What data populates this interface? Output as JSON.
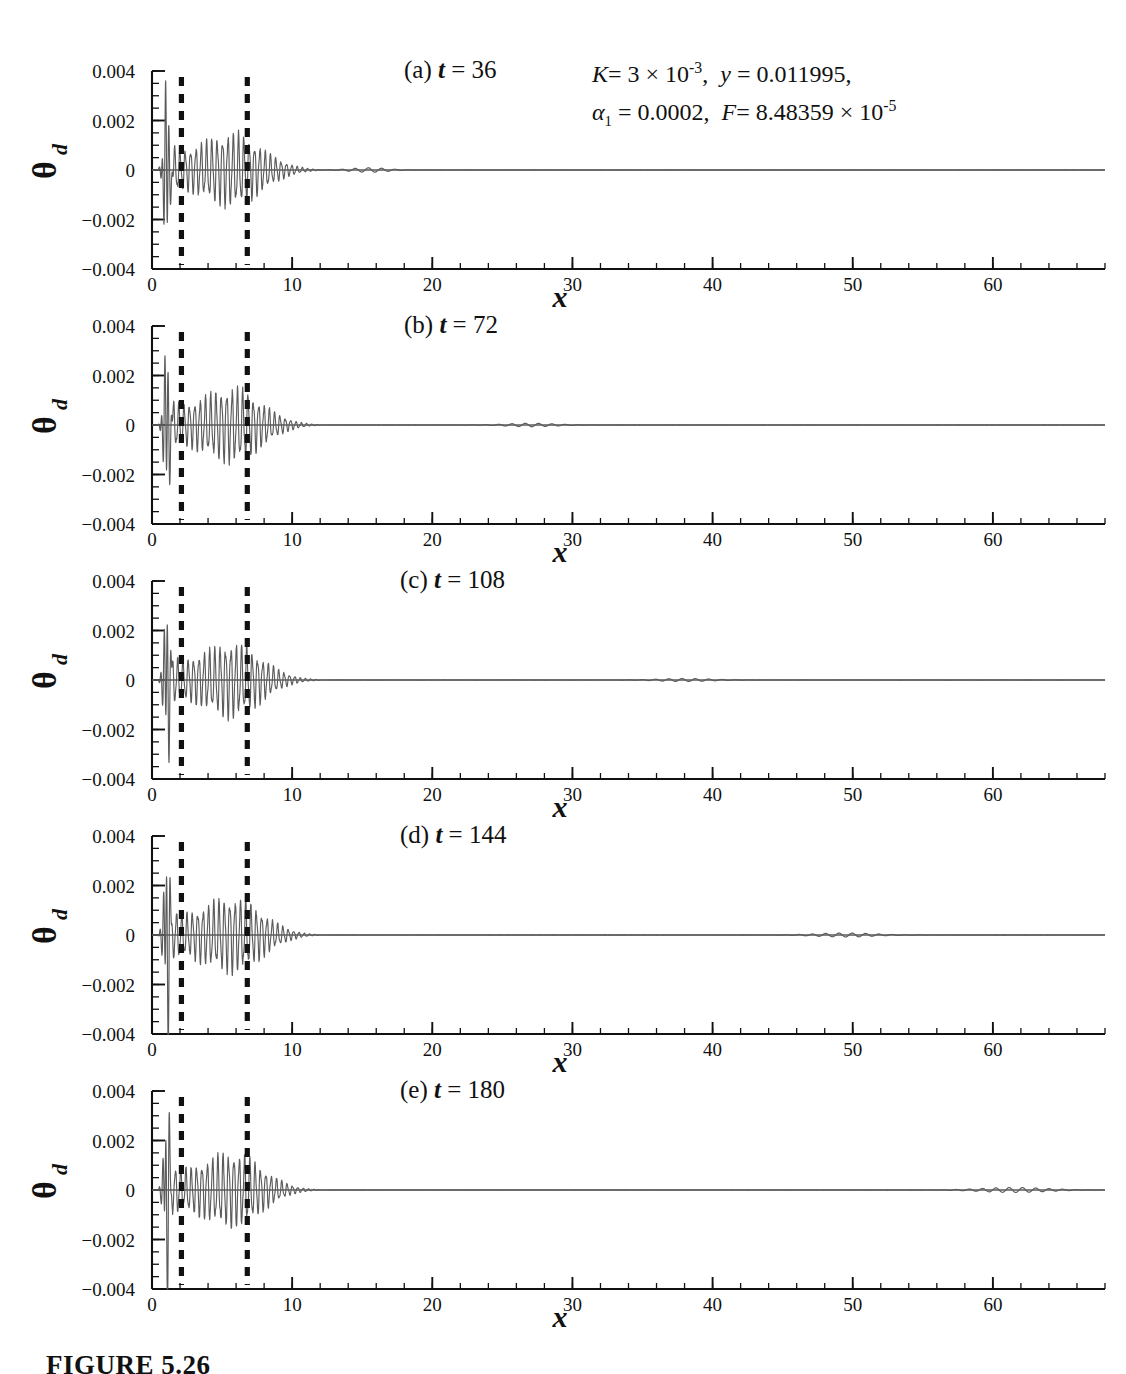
{
  "figure": {
    "caption": "FIGURE 5.26",
    "xlabel": "x",
    "ylabel_symbol": "θ",
    "ylabel_subscript": "d"
  },
  "parameters": {
    "line1_k_symbol": "K",
    "line1_k_value": "= 3 × 10",
    "line1_k_exp": "-3",
    "line1_y_symbol": "y",
    "line1_y_value": "= 0.011995,",
    "line2_alpha_symbol": "α",
    "line2_alpha_sub": "1",
    "line2_alpha_value": "= 0.0002,",
    "line2_f_symbol": "F",
    "line2_f_value": "= 8.48359 × 10",
    "line2_f_exp": "-5",
    "full_text": "K = 3 × 10^-3, y = 0.011995, α₁ = 0.0002, F = 8.48359 × 10^-5"
  },
  "axes": {
    "y_ticks": [
      "0.004",
      "0.002",
      "0",
      "−0.002",
      "−0.004"
    ],
    "y_tick_values": [
      0.004,
      0.002,
      0,
      -0.002,
      -0.004
    ],
    "y_range": [
      -0.004,
      0.004
    ],
    "x_ticks": [
      "0",
      "10",
      "20",
      "30",
      "40",
      "50",
      "60"
    ],
    "x_tick_values": [
      0,
      10,
      20,
      30,
      40,
      50,
      60
    ],
    "x_range": [
      0,
      68
    ],
    "x_minor_step": 2,
    "y_minor_step": 0.0005
  },
  "markers": {
    "label": "dashed vertical reference lines",
    "x_positions": [
      2.1,
      6.8
    ]
  },
  "panels": [
    {
      "id": "a",
      "tag": "(a)",
      "t_symbol": "t",
      "t_value": "= 36",
      "time": 36,
      "title_left": 404
    },
    {
      "id": "b",
      "tag": "(b)",
      "t_symbol": "t",
      "t_value": "= 72",
      "time": 72,
      "title_left": 404
    },
    {
      "id": "c",
      "tag": "(c)",
      "t_symbol": "t",
      "t_value": "= 108",
      "time": 108,
      "title_left": 400
    },
    {
      "id": "d",
      "tag": "(d)",
      "t_symbol": "t",
      "t_value": "= 144",
      "time": 144,
      "title_left": 400
    },
    {
      "id": "e",
      "tag": "(e)",
      "t_symbol": "t",
      "t_value": "= 180",
      "time": 180,
      "title_left": 400
    }
  ],
  "chart_data": {
    "type": "line",
    "xlabel": "x",
    "ylabel": "θ_d",
    "xlim": [
      0,
      68
    ],
    "ylim": [
      -0.004,
      0.004
    ],
    "grid": false,
    "legend": "none",
    "n_panels": 5,
    "annotations": [
      "K = 3 × 10^-3",
      "y = 0.011995",
      "α_1 = 0.0002",
      "F = 8.48359 × 10^-5"
    ],
    "vertical_markers_x": [
      2.1,
      6.8
    ],
    "series": [
      {
        "name": "(a) t = 36",
        "panel": "a",
        "carrier_wavelength": 0.38,
        "spike": {
          "x": 1.05,
          "half_width": 0.55,
          "amplitude": 0.003
        },
        "envelope_x": [
          1.3,
          1.8,
          2.1,
          2.6,
          3.2,
          3.8,
          4.4,
          5.0,
          5.6,
          6.2,
          6.8,
          7.4,
          8.0,
          8.6,
          9.2,
          9.8,
          10.5,
          11.2,
          12.0
        ],
        "envelope_y": [
          0.0009,
          0.00075,
          0.0007,
          0.00074,
          0.00085,
          0.00098,
          0.0011,
          0.00122,
          0.00128,
          0.00125,
          0.00112,
          0.00092,
          0.0007,
          0.0005,
          0.00034,
          0.00021,
          0.00011,
          5e-05,
          1e-05
        ],
        "downstream_packet": {
          "center": 15.5,
          "width": 2.2,
          "amplitude": 9e-05
        }
      },
      {
        "name": "(b) t = 72",
        "panel": "b",
        "carrier_wavelength": 0.38,
        "spike": {
          "x": 1.05,
          "half_width": 0.55,
          "amplitude": 0.0029
        },
        "envelope_x": [
          1.3,
          1.8,
          2.1,
          2.6,
          3.2,
          3.8,
          4.4,
          5.0,
          5.6,
          6.2,
          6.8,
          7.4,
          8.0,
          8.6,
          9.2,
          9.8,
          10.5,
          11.2,
          12.0
        ],
        "envelope_y": [
          0.00092,
          0.00078,
          0.00072,
          0.00076,
          0.00088,
          0.001,
          0.00112,
          0.00124,
          0.0013,
          0.00126,
          0.00114,
          0.00093,
          0.00071,
          0.0005,
          0.00033,
          0.0002,
          0.0001,
          4e-05,
          1e-05
        ],
        "downstream_packet": {
          "center": 27.0,
          "width": 3.0,
          "amplitude": 7e-05
        }
      },
      {
        "name": "(c) t = 108",
        "panel": "c",
        "carrier_wavelength": 0.38,
        "spike": {
          "x": 1.05,
          "half_width": 0.55,
          "amplitude": 0.0028
        },
        "envelope_x": [
          1.3,
          1.8,
          2.1,
          2.6,
          3.2,
          3.8,
          4.4,
          5.0,
          5.6,
          6.2,
          6.8,
          7.4,
          8.0,
          8.6,
          9.2,
          9.8,
          10.5,
          11.2,
          12.0
        ],
        "envelope_y": [
          0.0009,
          0.00076,
          0.00071,
          0.00075,
          0.00087,
          0.00099,
          0.00111,
          0.00123,
          0.00129,
          0.00125,
          0.00113,
          0.00092,
          0.0007,
          0.00049,
          0.00032,
          0.00019,
          9e-05,
          4e-05,
          1e-05
        ],
        "downstream_packet": {
          "center": 38.0,
          "width": 3.2,
          "amplitude": 6e-05
        }
      },
      {
        "name": "(d) t = 144",
        "panel": "d",
        "carrier_wavelength": 0.38,
        "spike": {
          "x": 1.05,
          "half_width": 0.55,
          "amplitude": 0.0031
        },
        "envelope_x": [
          1.3,
          1.8,
          2.1,
          2.6,
          3.2,
          3.8,
          4.4,
          5.0,
          5.6,
          6.2,
          6.8,
          7.4,
          8.0,
          8.6,
          9.2,
          9.8,
          10.5,
          11.2,
          12.0
        ],
        "envelope_y": [
          0.00094,
          0.00079,
          0.00073,
          0.00077,
          0.00089,
          0.00101,
          0.00113,
          0.00125,
          0.00131,
          0.00127,
          0.00115,
          0.00094,
          0.00072,
          0.00051,
          0.00034,
          0.0002,
          0.0001,
          4e-05,
          1e-05
        ],
        "downstream_packet": {
          "center": 49.5,
          "width": 3.6,
          "amplitude": 8e-05
        }
      },
      {
        "name": "(e) t = 180",
        "panel": "e",
        "carrier_wavelength": 0.38,
        "spike": {
          "x": 1.05,
          "half_width": 0.55,
          "amplitude": 0.003
        },
        "envelope_x": [
          1.3,
          1.8,
          2.1,
          2.6,
          3.2,
          3.8,
          4.4,
          5.0,
          5.6,
          6.2,
          6.8,
          7.4,
          8.0,
          8.6,
          9.2,
          9.8,
          10.5,
          11.2,
          12.0
        ],
        "envelope_y": [
          0.00092,
          0.00078,
          0.00072,
          0.00076,
          0.00088,
          0.001,
          0.00112,
          0.00124,
          0.0013,
          0.00126,
          0.00114,
          0.00093,
          0.00071,
          0.0005,
          0.00033,
          0.00019,
          9e-05,
          4e-05,
          1e-05
        ],
        "downstream_packet": {
          "center": 61.5,
          "width": 4.0,
          "amplitude": 0.0001
        }
      }
    ]
  }
}
